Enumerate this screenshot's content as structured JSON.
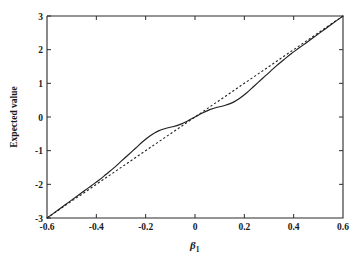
{
  "chart_data": {
    "type": "line",
    "title": "",
    "xlabel": "β₁",
    "xlabel_symbol": "β",
    "xlabel_subscript": "1",
    "ylabel": "Expected value",
    "xlim": [
      -0.6,
      0.6
    ],
    "ylim": [
      -3,
      3
    ],
    "xticks": [
      -0.6,
      -0.4,
      -0.2,
      0,
      0.2,
      0.4,
      0.6
    ],
    "xticklabels": [
      "-0.6",
      "-0.4",
      "-0.2",
      "0",
      "0.2",
      "0.4",
      "0.6"
    ],
    "yticks": [
      -3,
      -2,
      -1,
      0,
      1,
      2,
      3
    ],
    "yticklabels": [
      "-3",
      "-2",
      "-1",
      "0",
      "1",
      "2",
      "3"
    ],
    "grid": false,
    "legend": "none",
    "background_color": "#ffffff",
    "line_color": "#1f1f1f",
    "series": [
      {
        "name": "expected value curve",
        "style": "solid",
        "x": [
          -0.6,
          -0.57,
          -0.54,
          -0.51,
          -0.48,
          -0.45,
          -0.42,
          -0.39,
          -0.36,
          -0.33,
          -0.3,
          -0.27,
          -0.24,
          -0.21,
          -0.18,
          -0.15,
          -0.12,
          -0.09,
          -0.06,
          -0.03,
          0.0,
          0.03,
          0.06,
          0.09,
          0.12,
          0.15,
          0.18,
          0.21,
          0.24,
          0.27,
          0.3,
          0.33,
          0.36,
          0.39,
          0.42,
          0.45,
          0.48,
          0.51,
          0.54,
          0.57,
          0.6
        ],
        "y": [
          -3.0,
          -2.84,
          -2.68,
          -2.52,
          -2.36,
          -2.2,
          -2.04,
          -1.88,
          -1.7,
          -1.52,
          -1.32,
          -1.12,
          -0.92,
          -0.72,
          -0.55,
          -0.42,
          -0.34,
          -0.29,
          -0.22,
          -0.12,
          0.0,
          0.12,
          0.22,
          0.29,
          0.34,
          0.42,
          0.55,
          0.72,
          0.92,
          1.12,
          1.32,
          1.52,
          1.7,
          1.88,
          2.04,
          2.2,
          2.36,
          2.52,
          2.68,
          2.84,
          3.0
        ]
      },
      {
        "name": "reference line",
        "style": "dashed",
        "x": [
          -0.6,
          0.6
        ],
        "y": [
          -3.0,
          3.0
        ]
      }
    ]
  },
  "plot_geometry": {
    "left": 47,
    "right": 343,
    "top": 16,
    "bottom": 218,
    "tick_length": 4
  }
}
